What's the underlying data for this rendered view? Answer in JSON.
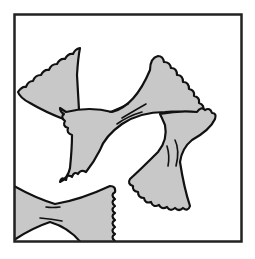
{
  "illustration": {
    "subject": "bow-tie pasta (farfalle)",
    "pieces": 4,
    "colors": {
      "background": "#ffffff",
      "pasta_fill": "#c8c8c8",
      "outline": "#111111",
      "frame": "#222222"
    }
  }
}
